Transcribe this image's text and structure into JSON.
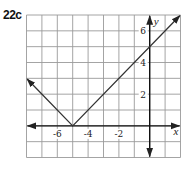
{
  "problem": {
    "label": "22c"
  },
  "chart_data": {
    "type": "line",
    "title": "",
    "xlabel": "x",
    "ylabel": "y",
    "xlim": [
      -8,
      2
    ],
    "ylim": [
      -2,
      7
    ],
    "grid": true,
    "grid_step": 1,
    "x_ticks": [
      {
        "value": -6,
        "label": "-6"
      },
      {
        "value": -4,
        "label": "-4"
      },
      {
        "value": -2,
        "label": "-2"
      }
    ],
    "y_ticks": [
      {
        "value": 6,
        "label": "6"
      },
      {
        "value": 4,
        "label": "4"
      },
      {
        "value": 2,
        "label": "2"
      }
    ],
    "series": [
      {
        "name": "y = |x + 5|",
        "points": [
          [
            -8,
            3
          ],
          [
            -5,
            0
          ],
          [
            2,
            7
          ]
        ],
        "arrows_at_ends": true
      }
    ],
    "vertex": [
      -5,
      0
    ],
    "y_intercept": 5
  },
  "colors": {
    "grid": "#9a9a9a",
    "axis": "#111111",
    "line": "#333333"
  }
}
